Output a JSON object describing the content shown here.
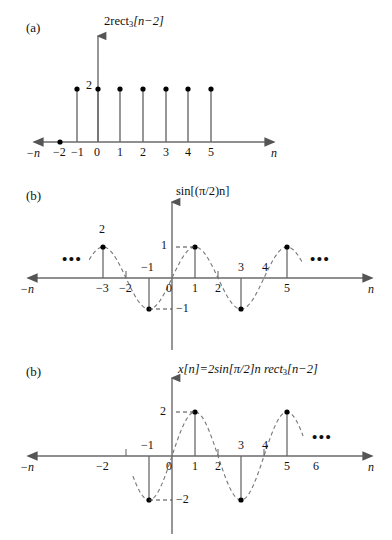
{
  "figure": {
    "width": 392,
    "height": 540,
    "background": "#ffffff",
    "line_color": "#555555",
    "dot_color": "#000000",
    "text_color": "#111111"
  },
  "panels": [
    {
      "id": "a",
      "label": "(a)",
      "title_plain": "2rect3[n-2]",
      "title_parts": {
        "pre": "2rect",
        "sub": "3",
        "post": "[n−2]"
      },
      "axis_left_label": "−n",
      "axis_right_label": "n",
      "value_markers": [
        {
          "text": "2",
          "value": 2
        }
      ],
      "ticks_below": [
        "−2",
        "−1",
        "0",
        "1",
        "2",
        "3",
        "4",
        "5"
      ],
      "ticks_above": [],
      "ellipsis": [],
      "chart_data": {
        "type": "bar",
        "title": "2rect₃[n−2]",
        "xlabel": "n",
        "ylabel": "",
        "x": [
          -2,
          -1,
          0,
          1,
          2,
          3,
          4,
          5
        ],
        "values": [
          0,
          2,
          2,
          2,
          2,
          2,
          2,
          2
        ],
        "ylim": [
          0,
          2.6
        ],
        "xlim": [
          -3.2,
          7.2
        ],
        "grid": false,
        "legend": "none",
        "annotations": [
          "2"
        ]
      }
    },
    {
      "id": "b1",
      "label": "(b)",
      "title_plain": "sin[(pi/2)n]",
      "title_parts": {
        "pre": "sin[(",
        "sub": "",
        "post": "π/2)n]"
      },
      "axis_left_label": "−n",
      "axis_right_label": "n",
      "value_markers": [
        {
          "text": "1",
          "value": 1
        },
        {
          "text": "−1",
          "value": -1
        }
      ],
      "ticks_below": [
        "−3",
        "−2",
        "0",
        "1",
        "2",
        "5"
      ],
      "ticks_above": [
        "−1",
        "3",
        "4"
      ],
      "stray_label": "2",
      "ellipsis": [
        "left",
        "right"
      ],
      "chart_data": {
        "type": "line",
        "title": "sin[(π/2)n]",
        "xlabel": "n",
        "ylabel": "",
        "x": [
          -3,
          -2,
          -1,
          0,
          1,
          2,
          3,
          4,
          5
        ],
        "values": [
          1,
          0,
          -1,
          0,
          1,
          0,
          -1,
          0,
          1
        ],
        "ylim": [
          -1.4,
          1.4
        ],
        "xlim": [
          -4.6,
          7.2
        ],
        "grid": false,
        "legend": "none",
        "annotations": [
          "1",
          "−1",
          "2",
          "•••",
          "•••"
        ]
      }
    },
    {
      "id": "b2",
      "label": "(b)",
      "title_plain": "x[n]=2sin[pi/2]n rect3[n-2]",
      "title_parts": {
        "pre": "x[n]=2sin[π/2]n rect",
        "sub": "3",
        "post": "[n−2]"
      },
      "axis_left_label": "−n",
      "axis_right_label": "n",
      "value_markers": [
        {
          "text": "2",
          "value": 2
        },
        {
          "text": "−2",
          "value": -2
        }
      ],
      "ticks_below": [
        "−2",
        "0",
        "1",
        "2",
        "5",
        "6"
      ],
      "ticks_above": [
        "−1",
        "3",
        "4"
      ],
      "ellipsis": [
        "right"
      ],
      "chart_data": {
        "type": "line",
        "title": "x[n]=2sin[π/2]n rect₃[n−2]",
        "xlabel": "n",
        "ylabel": "",
        "x": [
          -2,
          -1,
          0,
          1,
          2,
          3,
          4,
          5,
          6
        ],
        "values": [
          0,
          -2,
          0,
          2,
          0,
          -2,
          0,
          2,
          0
        ],
        "ylim": [
          -2.6,
          2.6
        ],
        "xlim": [
          -4.6,
          7.6
        ],
        "grid": false,
        "legend": "none",
        "annotations": [
          "2",
          "−2",
          "•••"
        ]
      }
    }
  ]
}
